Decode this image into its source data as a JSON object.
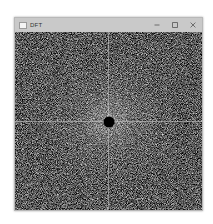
{
  "window": {
    "title": "DFT",
    "icon": "app-window-icon",
    "controls": {
      "minimize": {
        "icon": "minimize-icon",
        "glyph": "–"
      },
      "maximize": {
        "icon": "maximize-icon"
      },
      "close": {
        "icon": "close-icon",
        "glyph": "✕"
      }
    }
  },
  "content": {
    "description": "DFT magnitude spectrum (log-scaled, centered) with masked DC component",
    "center": {
      "x_pct": 50,
      "y_pct": 50
    },
    "dc_mask_color": "#000000",
    "background_color": "#000000",
    "axis_line_color": "#c8c8c8"
  },
  "colors": {
    "titlebar": "#c9c9c9",
    "title_text": "#333333",
    "viewport": "#000000"
  }
}
